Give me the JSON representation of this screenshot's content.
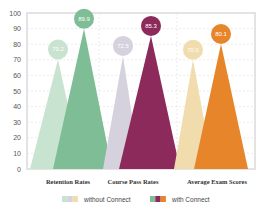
{
  "chart_data": {
    "type": "bar",
    "title": "",
    "xlabel": "",
    "ylabel": "",
    "ylim": [
      0,
      100
    ],
    "yticks": [
      0,
      10,
      20,
      30,
      40,
      50,
      60,
      70,
      80,
      90,
      100
    ],
    "grid": true,
    "categories": [
      "Retention Rates",
      "Course Pass Rates",
      "Average Exam Scores"
    ],
    "series": [
      {
        "name": "without Connect",
        "values": [
          70.2,
          72.5,
          70.0
        ],
        "labels": [
          "70.2",
          "72.5",
          "70.0"
        ],
        "colors": [
          "#c8e3cf",
          "#d5d1dd",
          "#f1dcae"
        ]
      },
      {
        "name": "with Connect",
        "values": [
          89.9,
          85.3,
          80.1
        ],
        "labels": [
          "89.9",
          "85.3",
          "80.1"
        ],
        "colors": [
          "#7ebd95",
          "#8c2a5c",
          "#e7852a"
        ]
      }
    ],
    "legend": {
      "position": "bottom",
      "entries": [
        "without Connect",
        "with Connect"
      ]
    },
    "mark_shape": "triangle"
  }
}
